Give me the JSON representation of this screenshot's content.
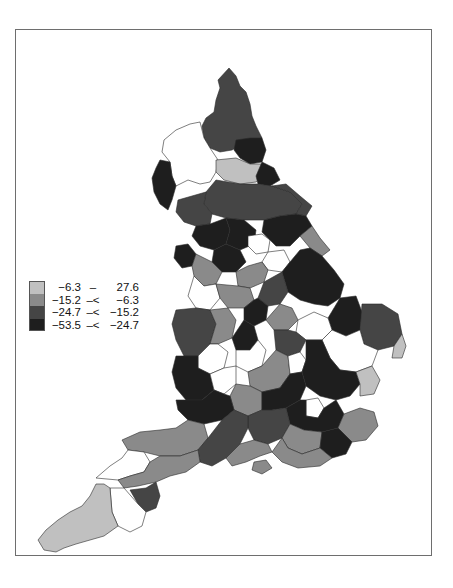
{
  "chart_data": {
    "type": "choropleth",
    "title": "",
    "legend": {
      "position": "left-middle",
      "classes": [
        {
          "low": "−6.3",
          "op": "–",
          "high": "27.6",
          "color": "#c0c0c0"
        },
        {
          "low": "−15.2",
          "op": "–<",
          "high": "−6.3",
          "color": "#8a8a8a"
        },
        {
          "low": "−24.7",
          "op": "–<",
          "high": "−15.2",
          "color": "#454545"
        },
        {
          "low": "−53.5",
          "op": "–<",
          "high": "−24.7",
          "color": "#1e1e1e"
        }
      ]
    },
    "missing_color": "#ffffff",
    "ranges": [
      [
        -6.3,
        27.6
      ],
      [
        -15.2,
        -6.3
      ],
      [
        -24.7,
        -15.2
      ],
      [
        -53.5,
        -24.7
      ]
    ]
  },
  "legend": {
    "rows": [
      {
        "low": "−6.3",
        "op": "–",
        "high": "27.6"
      },
      {
        "low": "−15.2",
        "op": "–<",
        "high": "−6.3"
      },
      {
        "low": "−24.7",
        "op": "–<",
        "high": "−15.2"
      },
      {
        "low": "−53.5",
        "op": "–<",
        "high": "−24.7"
      }
    ],
    "colors": [
      "#c0c0c0",
      "#8a8a8a",
      "#454545",
      "#1e1e1e"
    ]
  },
  "regions": [
    {
      "name": "northumberland",
      "cls": 2,
      "d": "M229,68 L236,76 L240,86 L246,92 L250,104 L252,116 L256,126 L262,138 L252,140 L242,144 L232,150 L220,152 L210,148 L204,138 L202,126 L206,118 L214,112 L216,100 L220,88 L218,80 Z"
    },
    {
      "name": "tyne-wear",
      "cls": 3,
      "d": "M236,140 L250,138 L262,138 L266,150 L262,162 L250,164 L240,158 L234,150 Z"
    },
    {
      "name": "cumbria",
      "cls": -1,
      "d": "M200,122 L204,138 L210,148 L218,160 L216,172 L210,182 L200,184 L188,180 L176,186 L172,176 L170,162 L162,152 L164,140 L176,130 L190,124 Z"
    },
    {
      "name": "cumbria-west",
      "cls": 3,
      "d": "M160,160 L170,162 L172,176 L176,186 L172,200 L168,210 L160,204 L154,192 L152,178 L156,168 Z"
    },
    {
      "name": "durham",
      "cls": 0,
      "d": "M216,160 L236,158 L250,164 L262,164 L264,176 L256,182 L240,184 L224,180 L216,172 Z"
    },
    {
      "name": "cleveland",
      "cls": 3,
      "d": "M262,162 L274,168 L280,180 L270,186 L258,184 L256,176 Z"
    },
    {
      "name": "north-yorks",
      "cls": 2,
      "d": "M216,180 L240,184 L258,184 L272,186 L290,192 L302,204 L296,214 L280,216 L264,220 L244,220 L226,218 L212,214 L204,204 L206,192 Z"
    },
    {
      "name": "north-yorks-east",
      "cls": 2,
      "d": "M272,186 L286,184 L300,196 L312,206 L306,216 L296,214 L302,204 L290,192 Z"
    },
    {
      "name": "lancs-north",
      "cls": 2,
      "d": "M178,200 L192,196 L206,192 L204,204 L212,214 L210,224 L196,226 L184,222 L176,212 Z"
    },
    {
      "name": "lancs-dark",
      "cls": 3,
      "d": "M196,226 L210,224 L226,218 L230,230 L226,244 L214,250 L200,246 L192,236 Z"
    },
    {
      "name": "yorks-dales",
      "cls": 3,
      "d": "M226,218 L244,220 L256,230 L254,244 L240,250 L226,244 L230,230 Z"
    },
    {
      "name": "leeds-white",
      "cls": -1,
      "d": "M248,236 L262,234 L270,240 L268,252 L256,254 L248,246 Z"
    },
    {
      "name": "west-yorks",
      "cls": 3,
      "d": "M214,250 L226,244 L240,250 L246,262 L236,272 L222,272 L212,262 Z"
    },
    {
      "name": "east-yorks",
      "cls": 3,
      "d": "M264,220 L280,216 L296,214 L306,216 L312,226 L300,236 L290,246 L276,246 L268,238 L262,232 Z"
    },
    {
      "name": "humberside-light",
      "cls": 1,
      "d": "M312,226 L320,238 L330,250 L322,256 L310,248 L300,236 Z"
    },
    {
      "name": "sheffield-white",
      "cls": -1,
      "d": "M268,252 L284,250 L290,262 L282,272 L268,270 L262,262 Z"
    },
    {
      "name": "liverpool",
      "cls": 3,
      "d": "M176,246 L188,244 L196,254 L192,266 L182,268 L174,258 Z"
    },
    {
      "name": "manchester-mix",
      "cls": 1,
      "d": "M196,254 L212,262 L222,272 L216,284 L204,286 L194,276 L192,266 Z"
    },
    {
      "name": "south-yorks",
      "cls": 1,
      "d": "M236,272 L248,266 L262,262 L268,270 L264,282 L250,288 L238,286 Z"
    },
    {
      "name": "lincs",
      "cls": 3,
      "d": "M282,272 L290,262 L300,250 L310,248 L322,256 L334,270 L344,284 L340,298 L328,306 L314,304 L300,300 L288,292 Z"
    },
    {
      "name": "notts",
      "cls": 2,
      "d": "M264,282 L282,272 L288,292 L280,304 L268,306 L258,298 Z"
    },
    {
      "name": "cheshire-white",
      "cls": -1,
      "d": "M194,276 L204,286 L216,284 L220,298 L210,310 L196,308 L188,296 Z"
    },
    {
      "name": "derby",
      "cls": 1,
      "d": "M216,284 L238,286 L250,288 L254,300 L244,308 L228,308 L220,298 Z"
    },
    {
      "name": "staffs-dark",
      "cls": 3,
      "d": "M244,308 L254,300 L258,298 L268,306 L266,320 L254,326 L244,320 Z"
    },
    {
      "name": "leics",
      "cls": 1,
      "d": "M266,320 L280,304 L292,308 L298,320 L288,330 L274,330 Z"
    },
    {
      "name": "norfolk-west",
      "cls": 3,
      "d": "M340,298 L356,296 L362,312 L360,330 L346,336 L332,330 L328,318 Z"
    },
    {
      "name": "norfolk-east",
      "cls": 2,
      "d": "M362,304 L382,304 L398,314 L402,334 L394,346 L378,350 L364,344 L360,330 Z"
    },
    {
      "name": "norfolk-coast",
      "cls": 0,
      "d": "M394,346 L402,334 L406,346 L402,358 L392,358 Z"
    },
    {
      "name": "wales-border",
      "cls": 2,
      "d": "M176,310 L196,308 L210,310 L216,324 L210,344 L198,356 L184,356 L176,340 L172,324 Z"
    },
    {
      "name": "shropshire",
      "cls": 1,
      "d": "M210,310 L228,308 L236,320 L232,338 L218,344 L210,344 L216,324 Z"
    },
    {
      "name": "birmingham",
      "cls": 3,
      "d": "M232,338 L244,320 L254,326 L258,340 L250,350 L236,350 Z"
    },
    {
      "name": "cambs",
      "cls": -1,
      "d": "M298,320 L314,312 L328,318 L332,330 L322,340 L306,340 L296,332 Z"
    },
    {
      "name": "suffolk",
      "cls": -1,
      "d": "M332,330 L346,336 L360,330 L364,344 L378,350 L372,366 L356,372 L340,370 L330,358 L322,340 Z"
    },
    {
      "name": "northants",
      "cls": 2,
      "d": "M274,330 L288,330 L296,332 L306,340 L300,352 L288,356 L276,350 Z"
    },
    {
      "name": "worcs-white",
      "cls": -1,
      "d": "M198,356 L210,344 L218,344 L228,352 L224,368 L210,374 L198,368 Z"
    },
    {
      "name": "warwick-white",
      "cls": -1,
      "d": "M236,350 L250,350 L258,340 L266,350 L262,366 L248,372 L236,366 Z"
    },
    {
      "name": "oxon",
      "cls": 1,
      "d": "M248,372 L262,366 L276,350 L288,356 L290,374 L280,388 L262,392 L250,386 Z"
    },
    {
      "name": "beds-white",
      "cls": -1,
      "d": "M288,356 L300,352 L306,360 L302,372 L290,374 Z"
    },
    {
      "name": "essex-dark",
      "cls": 3,
      "d": "M306,340 L322,340 L330,358 L340,370 L356,372 L360,384 L350,396 L336,400 L320,396 L306,386 L302,372 L306,360 Z"
    },
    {
      "name": "essex-light",
      "cls": 0,
      "d": "M356,372 L372,366 L380,380 L374,394 L360,396 L360,384 Z"
    },
    {
      "name": "gloucs",
      "cls": 3,
      "d": "M176,356 L198,356 L198,368 L210,374 L214,390 L202,400 L186,400 L176,388 L172,372 Z"
    },
    {
      "name": "glos-white",
      "cls": -1,
      "d": "M210,374 L224,368 L236,366 L236,384 L224,394 L214,390 Z"
    },
    {
      "name": "wilts-light",
      "cls": 1,
      "d": "M236,384 L250,386 L262,392 L262,410 L248,416 L234,410 L230,396 Z"
    },
    {
      "name": "bucks-dark",
      "cls": 3,
      "d": "M262,392 L280,388 L290,374 L302,372 L306,386 L300,400 L286,408 L272,410 L262,410 Z"
    },
    {
      "name": "london-white",
      "cls": -1,
      "d": "M306,400 L318,398 L324,408 L318,418 L306,416 Z"
    },
    {
      "name": "london-ring",
      "cls": 3,
      "d": "M286,408 L300,400 L306,400 L306,416 L318,418 L324,408 L336,400 L344,414 L338,428 L322,432 L304,430 L290,424 Z"
    },
    {
      "name": "kent-light",
      "cls": 1,
      "d": "M344,414 L360,408 L374,412 L378,426 L366,440 L352,442 L338,428 Z"
    },
    {
      "name": "somerset-n",
      "cls": 3,
      "d": "M176,400 L186,400 L202,400 L214,390 L224,394 L230,396 L234,410 L222,420 L204,424 L188,420 L178,410 Z"
    },
    {
      "name": "hants",
      "cls": 2,
      "d": "M248,416 L262,410 L272,410 L286,408 L290,424 L282,438 L268,444 L254,440 L248,428 Z"
    },
    {
      "name": "surrey",
      "cls": 1,
      "d": "M290,424 L304,430 L322,432 L320,448 L302,454 L288,448 L282,438 Z"
    },
    {
      "name": "sussex-dark",
      "cls": 3,
      "d": "M320,448 L322,432 L338,428 L352,442 L346,454 L332,458 Z"
    },
    {
      "name": "sussex-light",
      "cls": 1,
      "d": "M282,438 L288,448 L302,454 L320,448 L332,458 L320,466 L298,468 L282,462 L272,452 Z"
    },
    {
      "name": "somerset",
      "cls": 1,
      "d": "M122,440 L140,432 L160,430 L176,428 L188,420 L204,424 L208,438 L198,450 L180,456 L160,456 L144,452 L128,450 Z"
    },
    {
      "name": "dorset-dark",
      "cls": 2,
      "d": "M198,450 L208,438 L222,420 L234,410 L248,416 L248,428 L240,444 L226,458 L212,466 L200,462 Z"
    },
    {
      "name": "wight",
      "cls": 1,
      "d": "M254,462 L266,460 L272,468 L262,474 L252,470 Z"
    },
    {
      "name": "hants-south",
      "cls": 1,
      "d": "M226,458 L240,444 L254,440 L268,444 L272,452 L260,456 L246,462 L232,466 Z"
    },
    {
      "name": "devon-north",
      "cls": -1,
      "d": "M96,478 L110,466 L122,458 L128,450 L144,452 L150,462 L144,472 L130,476 L118,480 Z"
    },
    {
      "name": "devon-mid",
      "cls": 1,
      "d": "M118,480 L130,476 L144,472 L150,462 L160,456 L180,456 L198,450 L200,462 L186,472 L170,476 L156,482 L138,486 L124,488 Z"
    },
    {
      "name": "devon-dark",
      "cls": 2,
      "d": "M130,490 L146,488 L156,482 L160,496 L156,508 L146,512 L138,504 Z"
    },
    {
      "name": "devon-south",
      "cls": -1,
      "d": "M110,488 L124,488 L138,504 L146,512 L142,526 L130,532 L118,526 L112,512 Z"
    },
    {
      "name": "cornwall",
      "cls": 0,
      "d": "M58,520 L70,512 L82,506 L90,496 L96,484 L104,484 L110,488 L112,512 L118,526 L104,536 L90,540 L76,544 L64,548 L56,552 L44,550 L38,540 L46,530 Z"
    }
  ]
}
